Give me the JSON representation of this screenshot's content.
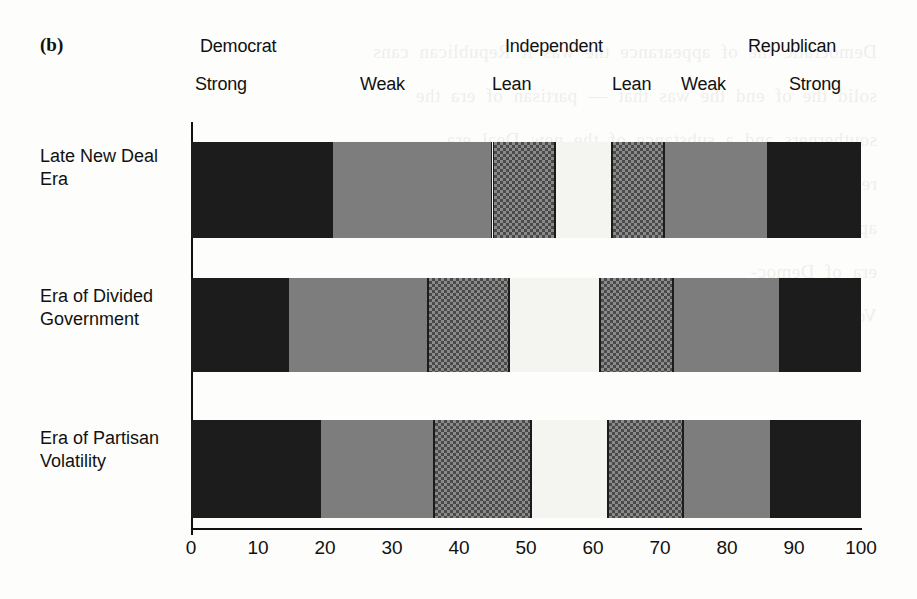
{
  "figure": {
    "panel_letter": "(b)",
    "ghost_text": "Democratic  the  of  appearance  the  was  it  Republican  cans\nsolid  the  of  end  the  was  that  —  partisan  of  era  the\nsoutherners  and  a  substance  of  the  new  Deal  era\nrepub-  1960s  and  the\nappearance  of  the\nera  of  Democ-\nVolatility  1980s"
  },
  "header": {
    "groups": [
      {
        "label": "Democrat",
        "left_px": 200,
        "name": "group-label-democrat"
      },
      {
        "label": "Independent",
        "left_px": 505,
        "name": "group-label-independent"
      },
      {
        "label": "Republican",
        "left_px": 748,
        "name": "group-label-republican"
      }
    ],
    "strengths": [
      {
        "label": "Strong",
        "left_px": 195,
        "name": "strength-label-democrat-strong"
      },
      {
        "label": "Weak",
        "left_px": 360,
        "name": "strength-label-democrat-weak"
      },
      {
        "label": "Lean",
        "left_px": 492,
        "name": "strength-label-democrat-lean"
      },
      {
        "label": "Lean",
        "left_px": 612,
        "name": "strength-label-republican-lean"
      },
      {
        "label": "Weak",
        "left_px": 681,
        "name": "strength-label-republican-weak"
      },
      {
        "label": "Strong",
        "left_px": 789,
        "name": "strength-label-republican-strong"
      }
    ]
  },
  "chart_data": {
    "type": "bar",
    "orientation": "horizontal",
    "stacked": true,
    "percent": true,
    "title": "(b)",
    "xlabel": "",
    "ylabel": "",
    "xlim": [
      0,
      100
    ],
    "xticks": [
      0,
      10,
      20,
      30,
      40,
      50,
      60,
      70,
      80,
      90,
      100
    ],
    "xticklabels": [
      "0",
      "10",
      "20",
      "30",
      "40",
      "50",
      "60",
      "70",
      "80",
      "90",
      "100"
    ],
    "grid": false,
    "legend": "none",
    "group_headers": [
      "Democrat",
      "Independent",
      "Republican"
    ],
    "categories": [
      "Late New Deal\nEra",
      "Era of Divided\nGovernment",
      "Era of Partisan\nVolatility"
    ],
    "series": [
      {
        "name": "Strong Democrat",
        "fill": "black",
        "values": [
          21.0,
          14.5,
          19.3
        ]
      },
      {
        "name": "Weak Democrat",
        "fill": "gray",
        "values": [
          24.0,
          20.9,
          17.0
        ]
      },
      {
        "name": "Lean Democrat",
        "fill": "check",
        "values": [
          9.3,
          12.1,
          14.4
        ]
      },
      {
        "name": "Independent",
        "fill": "white",
        "values": [
          8.5,
          13.5,
          11.5
        ]
      },
      {
        "name": "Lean Republican",
        "fill": "check",
        "values": [
          7.8,
          11.0,
          11.2
        ]
      },
      {
        "name": "Weak Republican",
        "fill": "gray",
        "values": [
          15.5,
          15.9,
          13.1
        ]
      },
      {
        "name": "Strong Republican",
        "fill": "black",
        "values": [
          13.9,
          12.1,
          13.5
        ]
      }
    ],
    "cumulative_boundaries": [
      [
        21.0,
        45.0,
        54.3,
        62.8,
        70.6,
        86.1,
        100.0
      ],
      [
        14.5,
        35.4,
        47.5,
        61.0,
        72.0,
        87.9,
        100.0
      ],
      [
        19.3,
        36.3,
        50.7,
        62.2,
        73.4,
        86.5,
        100.0
      ]
    ]
  },
  "colors": {
    "black": "#1c1c1c",
    "gray": "#7d7d7d",
    "white": "#f4f4f0",
    "check_bg": "#8a8a8a",
    "check_fg": "#4a4a4a",
    "axis": "#111111",
    "page": "#fdfdfb"
  }
}
